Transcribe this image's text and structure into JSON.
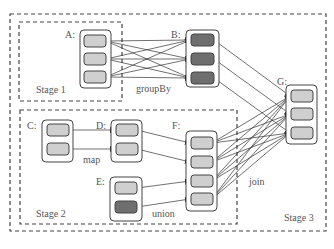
{
  "diagram": {
    "stages": [
      {
        "id": "stage1",
        "label": "Stage 1"
      },
      {
        "id": "stage2",
        "label": "Stage 2"
      },
      {
        "id": "stage3",
        "label": "Stage 3"
      }
    ],
    "nodes": [
      {
        "id": "A",
        "label": "A:",
        "partitions": [
          "light",
          "light",
          "light"
        ]
      },
      {
        "id": "B",
        "label": "B:",
        "partitions": [
          "dark",
          "dark",
          "dark"
        ]
      },
      {
        "id": "C",
        "label": "C:",
        "partitions": [
          "light",
          "light"
        ]
      },
      {
        "id": "D",
        "label": "D:",
        "partitions": [
          "light",
          "light"
        ]
      },
      {
        "id": "E",
        "label": "E:",
        "partitions": [
          "light",
          "dark"
        ]
      },
      {
        "id": "F",
        "label": "F:",
        "partitions": [
          "light",
          "light",
          "light",
          "light"
        ]
      },
      {
        "id": "G",
        "label": "G:",
        "partitions": [
          "light",
          "light",
          "light"
        ]
      }
    ],
    "operations": [
      {
        "label": "groupBy",
        "from": "A",
        "to": "B"
      },
      {
        "label": "map",
        "from": "C",
        "to": "D"
      },
      {
        "label": "union",
        "from": [
          "D",
          "E"
        ],
        "to": "F"
      },
      {
        "label": "join",
        "from": [
          "B",
          "F"
        ],
        "to": "G"
      }
    ],
    "colors": {
      "light_partition": "#cfcfcf",
      "dark_partition": "#6e6e6e",
      "outline": "#444444",
      "edge": "#333333"
    }
  }
}
